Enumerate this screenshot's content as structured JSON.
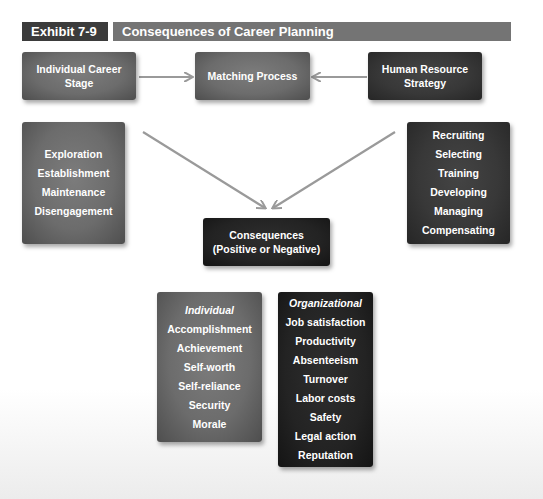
{
  "header": {
    "exhibit_label": "Exhibit 7-9",
    "title": "Consequences of Career Planning"
  },
  "top_row": {
    "left_box": [
      "Individual Career",
      "Stage"
    ],
    "center_box": "Matching Process",
    "right_box": [
      "Human Resource",
      "Strategy"
    ]
  },
  "career_stages": {
    "items": [
      "Exploration",
      "Establishment",
      "Maintenance",
      "Disengagement"
    ]
  },
  "hr_activities": {
    "items": [
      "Recruiting",
      "Selecting",
      "Training",
      "Developing",
      "Managing",
      "Compensating"
    ]
  },
  "consequences_box": {
    "line1": "Consequences",
    "line2": "(Positive or Negative)"
  },
  "individual_consequences": {
    "heading": "Individual",
    "items": [
      "Accomplishment",
      "Achievement",
      "Self-worth",
      "Self-reliance",
      "Security",
      "Morale"
    ]
  },
  "organizational_consequences": {
    "heading": "Organizational",
    "items": [
      "Job satisfaction",
      "Productivity",
      "Absenteeism",
      "Turnover",
      "Labor costs",
      "Safety",
      "Legal action",
      "Reputation"
    ]
  },
  "colors": {
    "exhibit_label_bg": "#3b3b3b",
    "title_bar_bg": "#747474",
    "gray_box": "#6c6c6c",
    "dark_box": "#383838",
    "darkest_box": "#232323",
    "arrow": "#9a9a9a",
    "text": "#ffffff"
  }
}
